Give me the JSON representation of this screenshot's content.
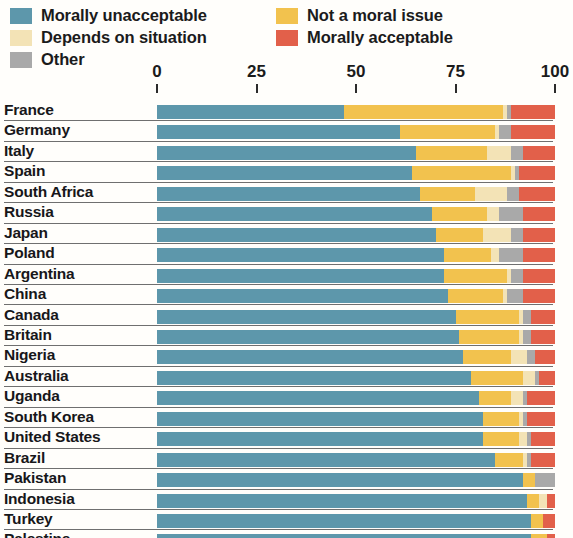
{
  "legend": {
    "items": [
      {
        "label": "Morally unacceptable",
        "color": "#5d97ab",
        "key": "unacceptable"
      },
      {
        "label": "Depends on situation",
        "color": "#f3e3b6",
        "key": "depends"
      },
      {
        "label": "Other",
        "color": "#a9a9a9",
        "key": "other"
      },
      {
        "label": "Not a moral issue",
        "color": "#f2c24e",
        "key": "not_issue"
      },
      {
        "label": "Morally acceptable",
        "color": "#e2604a",
        "key": "acceptable"
      }
    ]
  },
  "axis": {
    "ticks": [
      "0",
      "25",
      "50",
      "75",
      "100"
    ],
    "values": [
      0,
      25,
      50,
      75,
      100
    ]
  },
  "chart_data": {
    "type": "bar",
    "orientation": "horizontal",
    "stacked": true,
    "normalized_percent": true,
    "title": "",
    "subtitle": "",
    "xlabel": "",
    "ylabel": "",
    "xlim": [
      0,
      100
    ],
    "grid": false,
    "legend_position": "top",
    "series_order": [
      "Morally unacceptable",
      "Not a moral issue",
      "Depends on situation",
      "Other",
      "Morally acceptable"
    ],
    "series_colors": {
      "Morally unacceptable": "#5d97ab",
      "Not a moral issue": "#f2c24e",
      "Depends on situation": "#f3e3b6",
      "Other": "#a9a9a9",
      "Morally acceptable": "#e2604a"
    },
    "categories": [
      "France",
      "Germany",
      "Italy",
      "Spain",
      "South Africa",
      "Russia",
      "Japan",
      "Poland",
      "Argentina",
      "China",
      "Canada",
      "Britain",
      "Nigeria",
      "Australia",
      "Uganda",
      "South Korea",
      "United States",
      "Brazil",
      "Pakistan",
      "Indonesia",
      "Turkey",
      "Palestine"
    ],
    "rows": [
      {
        "category": "France",
        "unacceptable": 47,
        "not_issue": 40,
        "depends": 1,
        "other": 1,
        "acceptable": 11
      },
      {
        "category": "Germany",
        "unacceptable": 61,
        "not_issue": 24,
        "depends": 1,
        "other": 3,
        "acceptable": 11
      },
      {
        "category": "Italy",
        "unacceptable": 65,
        "not_issue": 18,
        "depends": 6,
        "other": 3,
        "acceptable": 8
      },
      {
        "category": "Spain",
        "unacceptable": 64,
        "not_issue": 25,
        "depends": 1,
        "other": 1,
        "acceptable": 9
      },
      {
        "category": "South Africa",
        "unacceptable": 66,
        "not_issue": 14,
        "depends": 8,
        "other": 3,
        "acceptable": 9
      },
      {
        "category": "Russia",
        "unacceptable": 69,
        "not_issue": 14,
        "depends": 3,
        "other": 6,
        "acceptable": 8
      },
      {
        "category": "Japan",
        "unacceptable": 70,
        "not_issue": 12,
        "depends": 7,
        "other": 3,
        "acceptable": 8
      },
      {
        "category": "Poland",
        "unacceptable": 72,
        "not_issue": 12,
        "depends": 2,
        "other": 6,
        "acceptable": 8
      },
      {
        "category": "Argentina",
        "unacceptable": 72,
        "not_issue": 16,
        "depends": 1,
        "other": 3,
        "acceptable": 8
      },
      {
        "category": "China",
        "unacceptable": 73,
        "not_issue": 14,
        "depends": 1,
        "other": 4,
        "acceptable": 8
      },
      {
        "category": "Canada",
        "unacceptable": 75,
        "not_issue": 16,
        "depends": 1,
        "other": 2,
        "acceptable": 6
      },
      {
        "category": "Britain",
        "unacceptable": 76,
        "not_issue": 15,
        "depends": 1,
        "other": 2,
        "acceptable": 6
      },
      {
        "category": "Nigeria",
        "unacceptable": 77,
        "not_issue": 12,
        "depends": 4,
        "other": 2,
        "acceptable": 5
      },
      {
        "category": "Australia",
        "unacceptable": 79,
        "not_issue": 13,
        "depends": 3,
        "other": 1,
        "acceptable": 4
      },
      {
        "category": "Uganda",
        "unacceptable": 81,
        "not_issue": 8,
        "depends": 3,
        "other": 1,
        "acceptable": 7
      },
      {
        "category": "South Korea",
        "unacceptable": 82,
        "not_issue": 9,
        "depends": 1,
        "other": 1,
        "acceptable": 7
      },
      {
        "category": "United States",
        "unacceptable": 82,
        "not_issue": 9,
        "depends": 2,
        "other": 1,
        "acceptable": 6
      },
      {
        "category": "Brazil",
        "unacceptable": 85,
        "not_issue": 7,
        "depends": 1,
        "other": 1,
        "acceptable": 6
      },
      {
        "category": "Pakistan",
        "unacceptable": 92,
        "not_issue": 3,
        "depends": 0,
        "other": 5,
        "acceptable": 0
      },
      {
        "category": "Indonesia",
        "unacceptable": 93,
        "not_issue": 3,
        "depends": 2,
        "other": 0,
        "acceptable": 2
      },
      {
        "category": "Turkey",
        "unacceptable": 94,
        "not_issue": 3,
        "depends": 0,
        "other": 0,
        "acceptable": 3
      },
      {
        "category": "Palestine",
        "unacceptable": 94,
        "not_issue": 4,
        "depends": 0,
        "other": 0,
        "acceptable": 2
      }
    ]
  }
}
